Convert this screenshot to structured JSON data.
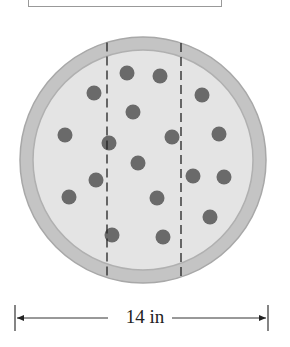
{
  "diagram": {
    "dimension_label": "14 in",
    "pizza": {
      "center": [
        143,
        160
      ],
      "radius": 123,
      "crust_color": "#c4c4c4",
      "cheese_color": "#e4e4e4",
      "topping_color": "#6a6a6a"
    },
    "cut_lines_x": [
      107,
      181
    ],
    "toppings": [
      [
        127,
        73
      ],
      [
        160,
        76
      ],
      [
        94,
        93
      ],
      [
        202,
        95
      ],
      [
        133,
        112
      ],
      [
        65,
        135
      ],
      [
        109,
        143
      ],
      [
        172,
        137
      ],
      [
        219,
        134
      ],
      [
        138,
        163
      ],
      [
        96,
        180
      ],
      [
        193,
        176
      ],
      [
        224,
        177
      ],
      [
        69,
        197
      ],
      [
        157,
        198
      ],
      [
        210,
        217
      ],
      [
        112,
        235
      ],
      [
        163,
        237
      ]
    ]
  }
}
